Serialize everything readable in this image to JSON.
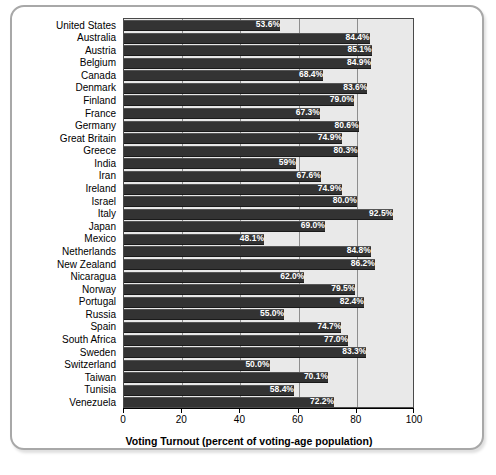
{
  "chart_data": {
    "type": "bar",
    "orientation": "horizontal",
    "title": "",
    "xlabel": "Voting Turnout (percent of voting-age population)",
    "ylabel": "",
    "xlim": [
      0,
      100
    ],
    "xticks": [
      "0",
      "20",
      "40",
      "60",
      "80",
      "100"
    ],
    "xtick_values": [
      0,
      20,
      40,
      60,
      80,
      100
    ],
    "grid": "vertical",
    "legend": "none",
    "bar_color": "#333333",
    "plot_background": "#e9e9e9",
    "categories": [
      "United States",
      "Australia",
      "Austria",
      "Belgium",
      "Canada",
      "Denmark",
      "Finland",
      "France",
      "Germany",
      "Great Britain",
      "Greece",
      "India",
      "Iran",
      "Ireland",
      "Israel",
      "Italy",
      "Japan",
      "Mexico",
      "Netherlands",
      "New Zealand",
      "Nicaragua",
      "Norway",
      "Portugal",
      "Russia",
      "Spain",
      "South Africa",
      "Sweden",
      "Switzerland",
      "Taiwan",
      "Tunisia",
      "Venezuela"
    ],
    "values": [
      53.6,
      84.4,
      85.1,
      84.9,
      68.4,
      83.6,
      79.0,
      67.3,
      80.6,
      74.9,
      80.3,
      59.0,
      67.6,
      74.9,
      80.0,
      92.5,
      69.0,
      48.1,
      84.8,
      86.2,
      62.0,
      79.5,
      82.4,
      55.0,
      74.7,
      77.0,
      83.3,
      50.0,
      70.1,
      58.4,
      72.2
    ],
    "value_labels": [
      "53.6%",
      "84.4%",
      "85.1%",
      "84.9%",
      "68.4%",
      "83.6%",
      "79.0%",
      "67.3%",
      "80.6%",
      "74.9%",
      "80.3%",
      "59%",
      "67.6%",
      "74.9%",
      "80.0%",
      "92.5%",
      "69.0%",
      "48.1%",
      "84.8%",
      "86.2%",
      "62.0%",
      "79.5%",
      "82.4%",
      "55.0%",
      "74.7%",
      "77.0%",
      "83.3%",
      "50.0%",
      "70.1%",
      "58.4%",
      "72.2%"
    ]
  }
}
